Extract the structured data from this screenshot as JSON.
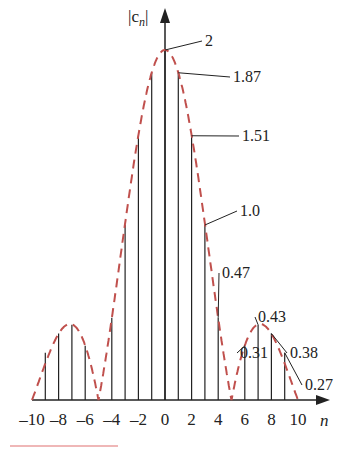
{
  "chart_data": {
    "type": "bar",
    "title": "",
    "xlabel": "n",
    "ylabel": "|c_n|",
    "x": [
      -10,
      -9,
      -8,
      -7,
      -6,
      -5,
      -4,
      -3,
      -2,
      -1,
      0,
      1,
      2,
      3,
      4,
      5,
      6,
      7,
      8,
      9,
      10
    ],
    "values": [
      0,
      0.27,
      0.38,
      0.43,
      0.31,
      0,
      0.47,
      1.0,
      1.51,
      1.87,
      2,
      1.87,
      1.51,
      1.0,
      0.47,
      0,
      0.31,
      0.43,
      0.38,
      0.27,
      0
    ],
    "xticks": [
      "-10",
      "-8",
      "-6",
      "-4",
      "-2",
      "0",
      "2",
      "4",
      "6",
      "8",
      "10"
    ],
    "annotations": [
      {
        "n": 0,
        "text": "2"
      },
      {
        "n": 1,
        "text": "1.87"
      },
      {
        "n": 2,
        "text": "1.51"
      },
      {
        "n": 3,
        "text": "1.0"
      },
      {
        "n": 4,
        "text": "0.47"
      },
      {
        "n": 6,
        "text": "0.31"
      },
      {
        "n": 7,
        "text": "0.43"
      },
      {
        "n": 8,
        "text": "0.38"
      },
      {
        "n": 9,
        "text": "0.27"
      }
    ],
    "envelope": {
      "style": "dashed",
      "color": "#c0504d"
    },
    "stem_color": "#222222",
    "grid": false
  },
  "labels": {
    "y_axis": "|c",
    "y_sub": "n",
    "x_axis": "n"
  }
}
